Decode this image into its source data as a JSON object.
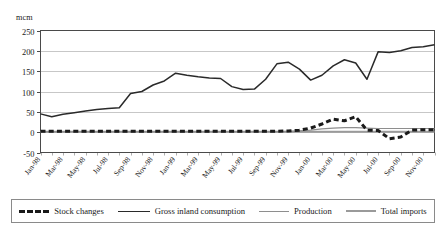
{
  "chart_data": {
    "type": "line",
    "title": "",
    "ylabel": "mcm",
    "xlabel": "",
    "ylim": [
      -50,
      250
    ],
    "ytick_values": [
      250,
      200,
      150,
      100,
      50,
      0,
      -50
    ],
    "ytick_labels": [
      "250",
      "200",
      "150",
      "100",
      "50",
      "0",
      "-50"
    ],
    "grid": true,
    "legend_position": "bottom",
    "x": [
      "Jan-98",
      "Feb-98",
      "Mar-98",
      "Apr-98",
      "May-98",
      "Jun-98",
      "Jul-98",
      "Aug-98",
      "Sep-98",
      "Oct-98",
      "Nov-98",
      "Dec-98",
      "Jan-99",
      "Feb-99",
      "Mar-99",
      "Apr-99",
      "May-99",
      "Jun-99",
      "Jul-99",
      "Aug-99",
      "Sep-99",
      "Oct-99",
      "Nov-99",
      "Dec-99",
      "Jan-00",
      "Feb-00",
      "Mar-00",
      "Apr-00",
      "May-00",
      "Jun-00",
      "Jul-00",
      "Aug-00",
      "Sep-00",
      "Oct-00",
      "Nov-00",
      "Dec-00"
    ],
    "xtick_labels": [
      "Jan-98",
      "Mar-98",
      "May-98",
      "Jul-98",
      "Sep-98",
      "Nov-98",
      "Jan-99",
      "Mar-99",
      "May-99",
      "Jul-99",
      "Sep-99",
      "Nov-99",
      "Jan-00",
      "Mar-00",
      "May-00",
      "Jul-00",
      "Sep-00",
      "Nov-00"
    ],
    "series": [
      {
        "name": "Stock changes",
        "style": "thick-dashed",
        "color": "#1a1a1a",
        "values": [
          2,
          2,
          2,
          2,
          2,
          2,
          2,
          2,
          2,
          2,
          2,
          2,
          2,
          2,
          2,
          2,
          2,
          2,
          2,
          2,
          2,
          2,
          3,
          5,
          10,
          20,
          32,
          28,
          38,
          5,
          4,
          -16,
          -12,
          5,
          6,
          6
        ]
      },
      {
        "name": "Gross inland consumption",
        "style": "thin-solid",
        "color": "#2a2a2a",
        "values": [
          45,
          38,
          44,
          48,
          52,
          56,
          58,
          60,
          95,
          100,
          116,
          126,
          145,
          140,
          136,
          133,
          132,
          112,
          105,
          106,
          130,
          168,
          172,
          155,
          128,
          140,
          163,
          178,
          170,
          130,
          198,
          196,
          200,
          208,
          210,
          215
        ]
      },
      {
        "name": "Production",
        "style": "thin-solid-gray",
        "color": "#8e8e8e",
        "values": [
          1,
          1,
          1,
          1,
          1,
          1,
          1,
          1,
          1,
          1,
          1,
          1,
          1,
          1,
          1,
          1,
          1,
          1,
          1,
          1,
          1,
          1,
          2,
          3,
          5,
          8,
          10,
          11,
          11,
          10,
          9,
          9,
          9,
          9,
          9,
          9
        ]
      },
      {
        "name": "Total imports",
        "style": "thick-solid-gray",
        "color": "#9a9a9a",
        "values": [
          1,
          1,
          1,
          1,
          1,
          1,
          1,
          1,
          1,
          1,
          1,
          1,
          1,
          1,
          1,
          1,
          1,
          1,
          1,
          1,
          1,
          1,
          1,
          1,
          1,
          1,
          1,
          1,
          1,
          1,
          1,
          1,
          1,
          1,
          1,
          1
        ]
      }
    ]
  },
  "legend": {
    "items": [
      {
        "label": "Stock changes"
      },
      {
        "label": "Gross inland consumption"
      },
      {
        "label": "Production"
      },
      {
        "label": "Total imports"
      }
    ]
  }
}
